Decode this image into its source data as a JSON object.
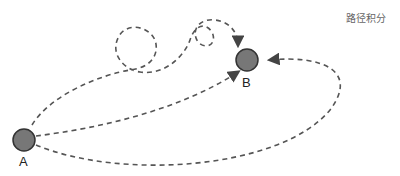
{
  "title": "路径积分",
  "nodes": {
    "a": {
      "label": "A",
      "fill": "#777777"
    },
    "b": {
      "label": "B",
      "fill": "#777777"
    }
  },
  "paths": [
    "direct",
    "lower-arc",
    "looping",
    "right-loop"
  ]
}
